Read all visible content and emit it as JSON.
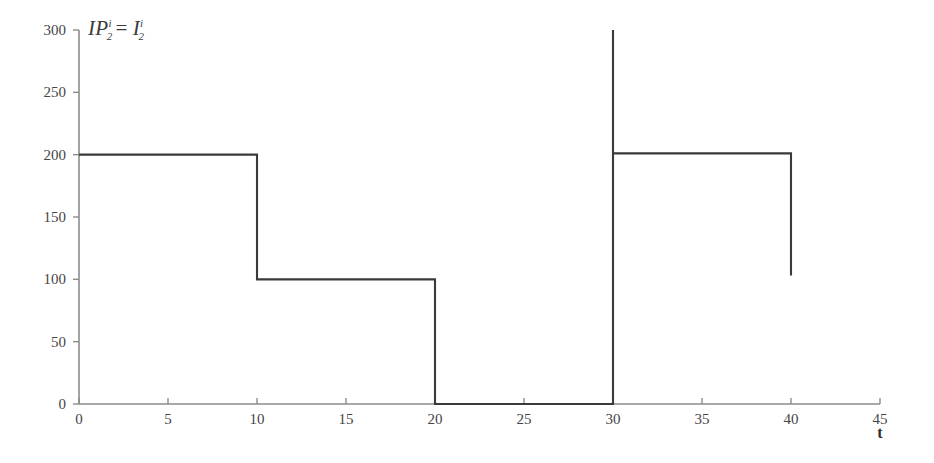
{
  "chart_data": {
    "type": "line",
    "subtype": "step-post",
    "title": "",
    "series_label": {
      "lhs_base": "IP",
      "lhs_sup": "i",
      "lhs_sub": "2",
      "equals": "=",
      "rhs_base": "I",
      "rhs_sup": "i",
      "rhs_sub": "2",
      "plain": "IP_2^i = I_2^i"
    },
    "xlabel": "t",
    "ylabel": "",
    "xlim": [
      0,
      45
    ],
    "ylim": [
      0,
      300
    ],
    "xticks": [
      0,
      5,
      10,
      15,
      20,
      25,
      30,
      35,
      40,
      45
    ],
    "yticks": [
      0,
      50,
      100,
      150,
      200,
      250,
      300
    ],
    "xtick_labels": [
      "0",
      "5",
      "10",
      "15",
      "20",
      "25",
      "30",
      "35",
      "40",
      "45"
    ],
    "ytick_labels": [
      "0",
      "50",
      "100",
      "150",
      "200",
      "250",
      "300"
    ],
    "grid": false,
    "legend": false,
    "line_color": "#3a3a3a",
    "axis_color": "#8c8c8c",
    "steps": [
      {
        "x_start": 0,
        "x_end": 10,
        "value": 200
      },
      {
        "x_start": 10,
        "x_end": 20,
        "value": 100
      },
      {
        "x_start": 20,
        "x_end": 30,
        "value": 0
      },
      {
        "x_start": 30,
        "x_end": 40,
        "value": 201
      }
    ],
    "spike": {
      "x": 30,
      "from": 0,
      "to": 300
    },
    "end_drop": {
      "x": 40,
      "from": 201,
      "to": 103
    },
    "x": [
      0,
      10,
      10,
      20,
      20,
      30,
      30,
      30,
      30,
      40,
      40
    ],
    "y": [
      200,
      200,
      100,
      100,
      0,
      0,
      300,
      300,
      201,
      201,
      103
    ]
  }
}
